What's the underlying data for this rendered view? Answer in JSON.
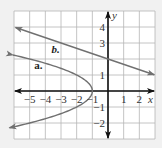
{
  "chart_data": {
    "type": "line",
    "title": "",
    "xlabel": "x",
    "ylabel": "y",
    "xlim": [
      -6,
      3
    ],
    "ylim": [
      -3,
      5
    ],
    "grid": true,
    "x_ticks": [
      -5,
      -4,
      -3,
      -2,
      -1,
      1,
      2
    ],
    "y_ticks": [
      4,
      3,
      1,
      -1,
      -2
    ],
    "x_tick_labels": [
      "−5",
      "−4",
      "−3",
      "−2",
      "−1",
      "1",
      "2"
    ],
    "y_tick_labels": [
      "4",
      "3",
      "1",
      "−1",
      "−2"
    ],
    "series": [
      {
        "name": "a.",
        "kind": "parabola",
        "equation": "x = -y^2 - 1",
        "vertex": [
          -1,
          0
        ],
        "y_range": [
          -2.3,
          2.25
        ],
        "arrows": "both"
      },
      {
        "name": "b.",
        "kind": "line",
        "equation": "y = -x/3 + 2",
        "slope": -0.3333,
        "y_intercept": 2,
        "x_range": [
          -5.9,
          2.95
        ],
        "arrows": "both"
      }
    ],
    "colors": {
      "grid": "#b5b5b5",
      "axes": "#111111",
      "curves": "#707070",
      "background": "#ffffff"
    }
  }
}
